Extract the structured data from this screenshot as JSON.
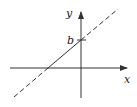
{
  "diagram": {
    "type": "linear-function-graph",
    "axes": {
      "x_label": "x",
      "y_label": "y"
    },
    "y_intercept_label": "b",
    "line": {
      "description": "line with positive slope crossing y-axis at b; solid between x- and y-intercepts, dashed elsewhere",
      "color": "#333333"
    },
    "colors": {
      "stroke": "#333333",
      "background": "#ffffff"
    }
  }
}
